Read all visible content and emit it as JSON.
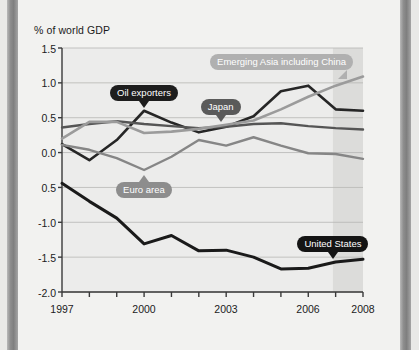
{
  "chart_data": {
    "type": "line",
    "title": "",
    "subtitle": "",
    "ylabel": "% of world GDP",
    "xlabel": "",
    "grid": true,
    "legend_position": "inline-callouts",
    "x": [
      1997,
      1998,
      1999,
      2000,
      2001,
      2002,
      2003,
      2004,
      2005,
      2006,
      2007,
      2008
    ],
    "xlim": [
      1997,
      2008
    ],
    "ylim": [
      -2.0,
      1.5
    ],
    "xticks": [
      1997,
      1998,
      1999,
      2000,
      2001,
      2002,
      2003,
      2004,
      2005,
      2006,
      2007,
      2008
    ],
    "xtick_labels": [
      "1997",
      "",
      "",
      "2000",
      "",
      "",
      "2003",
      "",
      "",
      "2006",
      "",
      "2008"
    ],
    "yticks": [
      1.5,
      1.0,
      0.5,
      0.0,
      -0.5,
      -1.0,
      -1.5,
      -2.0
    ],
    "ytick_labels": [
      "1.5",
      "1.0",
      "0.5",
      "0.0",
      "0.5",
      "-1.0",
      "-1.5",
      "-2.0"
    ],
    "forecast_band": {
      "start": 2006.9,
      "end": 2008,
      "label": ""
    },
    "series": [
      {
        "name": "Oil exporters",
        "color": "#262626",
        "width": 2.6,
        "values": [
          0.12,
          -0.11,
          0.18,
          0.6,
          0.43,
          0.29,
          0.37,
          0.52,
          0.88,
          0.96,
          0.62,
          0.6
        ]
      },
      {
        "name": "Japan",
        "color": "#555555",
        "width": 2.4,
        "values": [
          0.36,
          0.41,
          0.45,
          0.41,
          0.38,
          0.35,
          0.37,
          0.41,
          0.42,
          0.38,
          0.35,
          0.33
        ]
      },
      {
        "name": "Emerging Asia including China",
        "color": "#9b9b9b",
        "width": 2.6,
        "values": [
          0.2,
          0.44,
          0.44,
          0.28,
          0.3,
          0.34,
          0.4,
          0.46,
          0.62,
          0.8,
          0.96,
          1.09
        ]
      },
      {
        "name": "Euro area",
        "color": "#868686",
        "width": 2.4,
        "values": [
          0.11,
          0.04,
          -0.08,
          -0.25,
          -0.06,
          0.18,
          0.1,
          0.22,
          0.1,
          -0.01,
          -0.02,
          -0.09
        ]
      },
      {
        "name": "United States",
        "color": "#1a1a1a",
        "width": 3.0,
        "values": [
          -0.44,
          -0.7,
          -0.94,
          -1.31,
          -1.19,
          -1.41,
          -1.4,
          -1.5,
          -1.67,
          -1.66,
          -1.57,
          -1.53
        ]
      }
    ],
    "annotations": [
      {
        "id": "oil-exporters",
        "text": "Oil exporters",
        "bg": "#1d1d1d",
        "text_color": "#ffffff",
        "tail": "down",
        "points_at_x": 2000,
        "points_at_y": 0.6
      },
      {
        "id": "japan",
        "text": "Japan",
        "bg": "#5a5a5a",
        "text_color": "#ffffff",
        "tail": "down",
        "points_at_x": 2002.8,
        "points_at_y": 0.36
      },
      {
        "id": "emerging-asia",
        "text": "Emerging Asia including China",
        "bg": "#b0b0b0",
        "text_color": "#ffffff",
        "tail": "down-right",
        "points_at_x": 2007.2,
        "points_at_y": 0.98
      },
      {
        "id": "euro-area",
        "text": "Euro area",
        "bg": "#8d8d8d",
        "text_color": "#ffffff",
        "tail": "up",
        "points_at_x": 2000,
        "points_at_y": -0.25
      },
      {
        "id": "united-states",
        "text": "United States",
        "bg": "#141414",
        "text_color": "#ffffff",
        "tail": "down",
        "points_at_x": 2006.9,
        "points_at_y": -1.57
      }
    ]
  },
  "axis": {
    "ylabel": "% of world GDP"
  },
  "ylabels": {
    "t0": "1.5",
    "t1": "1.0",
    "t2": "0.5",
    "t3": "0.0",
    "t4": "0.5",
    "t5": "-1.0",
    "t6": "-1.5",
    "t7": "-2.0"
  },
  "xlabels": {
    "x0": "1997",
    "x1": "2000",
    "x2": "2003",
    "x3": "2006",
    "x4": "2008"
  },
  "callouts": {
    "oil": "Oil exporters",
    "japan": "Japan",
    "asia": "Emerging Asia including China",
    "euro": "Euro area",
    "us": "United States"
  },
  "colors": {
    "plot_bg": "#ececeb",
    "forecast_bg": "#dcdcda",
    "grid": "#b6b6b4",
    "axis": "#3a3a3a",
    "page_bg": "#f2f2f0"
  }
}
